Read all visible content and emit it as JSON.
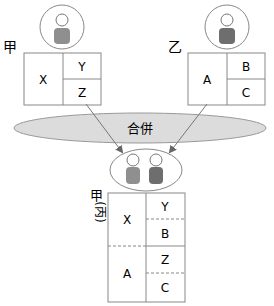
{
  "diagram": {
    "title": "合併",
    "parties": [
      {
        "label": "甲",
        "cells": {
          "left": "X",
          "top_right": "Y",
          "bottom_right": "Z"
        }
      },
      {
        "label": "乙",
        "cells": {
          "left": "A",
          "top_right": "B",
          "bottom_right": "C"
        }
      }
    ],
    "merged": {
      "label_top": "甲",
      "label_paren": "(丙)",
      "rows": [
        {
          "left": "X",
          "right": [
            "Y",
            "B"
          ]
        },
        {
          "left": "A",
          "right": [
            "Z",
            "C"
          ]
        }
      ]
    },
    "colors": {
      "line": "#8a8a8a",
      "ellipse_fill": "#dcdcdc",
      "person_light": "#8f8f8f",
      "person_dark": "#6e6e6e",
      "arrow": "#777777"
    }
  }
}
